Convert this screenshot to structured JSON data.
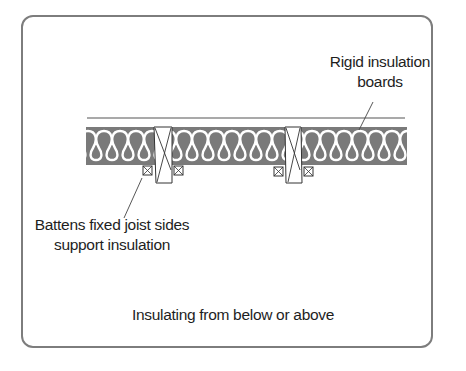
{
  "diagram": {
    "title": "Insulating from below or above",
    "labels": {
      "rigid_boards_line1": "Rigid insulation",
      "rigid_boards_line2": "boards",
      "battens_line1": "Battens fixed joist sides",
      "battens_line2": "support insulation"
    },
    "components": [
      "rigid insulation boards",
      "insulation quilt",
      "joist",
      "joist",
      "battens"
    ],
    "colors": {
      "frame": "#7d7d7d",
      "insulation_fill": "#7a7a7a",
      "insulation_wave": "#ffffff",
      "line": "#333333",
      "text": "#1e1e1e"
    }
  }
}
